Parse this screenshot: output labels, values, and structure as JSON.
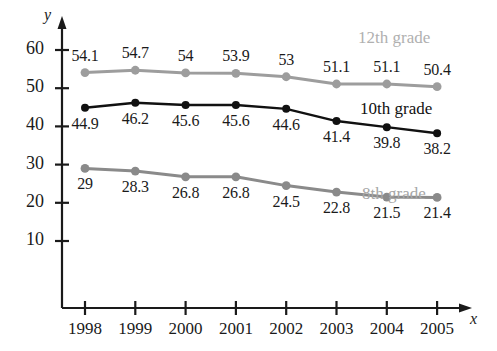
{
  "chart_data": {
    "type": "line",
    "title": "",
    "xlabel": "x",
    "ylabel": "y",
    "categories": [
      "1998",
      "1999",
      "2000",
      "2001",
      "2002",
      "2003",
      "2004",
      "2005"
    ],
    "x": [
      1998,
      1999,
      2000,
      2001,
      2002,
      2003,
      2004,
      2005
    ],
    "xlim": [
      1997.55,
      2005.7
    ],
    "ylim": [
      0,
      63
    ],
    "yticks": [
      10,
      20,
      30,
      40,
      50,
      60
    ],
    "ytick_labels": [
      "10",
      "20",
      "30",
      "40",
      "50",
      "60"
    ],
    "xtick_labels": [
      "1998",
      "1999",
      "2000",
      "2001",
      "2002",
      "2003",
      "2004",
      "2005"
    ],
    "grid": false,
    "legend_position": "inline-right",
    "series": [
      {
        "name": "12th grade",
        "color": "#9d9d9d",
        "values": [
          54.1,
          54.7,
          54.0,
          53.9,
          53.0,
          51.1,
          51.1,
          50.4
        ],
        "value_labels": [
          "54.1",
          "54.7",
          "54",
          "53.9",
          "53",
          "51.1",
          "51.1",
          "50.4"
        ],
        "label_positions": [
          "above",
          "above",
          "above",
          "above",
          "above",
          "above",
          "above",
          "above"
        ]
      },
      {
        "name": "10th grade",
        "color": "#111111",
        "values": [
          44.9,
          46.2,
          45.6,
          45.6,
          44.6,
          41.4,
          39.8,
          38.2
        ],
        "value_labels": [
          "44.9",
          "46.2",
          "45.6",
          "45.6",
          "44.6",
          "41.4",
          "39.8",
          "38.2"
        ],
        "label_positions": [
          "below",
          "below",
          "below",
          "below",
          "below",
          "below",
          "below",
          "below"
        ]
      },
      {
        "name": "8th grade",
        "color": "#8a8a8a",
        "values": [
          29.0,
          28.3,
          26.8,
          26.8,
          24.5,
          22.8,
          21.5,
          21.4
        ],
        "value_labels": [
          "29",
          "28.3",
          "26.8",
          "26.8",
          "24.5",
          "22.8",
          "21.5",
          "21.4"
        ],
        "label_positions": [
          "below",
          "below",
          "below",
          "below",
          "below",
          "below",
          "below",
          "below"
        ]
      }
    ],
    "annotations": [
      {
        "text": "12th grade",
        "color": "#b0b0b0"
      },
      {
        "text": "10th grade",
        "color": "#111111"
      },
      {
        "text": "8th grade",
        "color": "#a6a6a6"
      }
    ]
  },
  "axes": {
    "x_axis_label": "x",
    "y_axis_label": "y"
  },
  "colors": {
    "axis": "#1a1a1a",
    "text": "#1a1a1a",
    "background": "#ffffff",
    "series_12th": "#9d9d9d",
    "series_10th": "#111111",
    "series_8th": "#8a8a8a",
    "label_12th": "#b0b0b0",
    "label_8th": "#a6a6a6"
  }
}
